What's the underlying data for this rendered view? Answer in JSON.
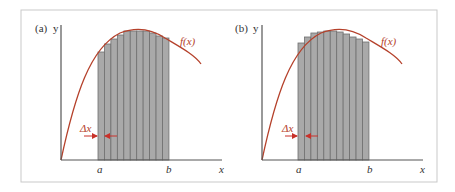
{
  "figure": {
    "frame": {
      "x": 21,
      "y": 10,
      "w": 416,
      "h": 172,
      "stroke": "#c9c9c9"
    },
    "colors": {
      "axis": "#555555",
      "curve": "#b5412b",
      "bar_fill": "#a9a9a9",
      "bar_stroke": "#6f6f6f",
      "arrow": "#c8312a",
      "text": "#333333"
    },
    "panels": [
      {
        "id": "a",
        "panel_label": "(a)",
        "y_label": "y",
        "x_label": "x",
        "a_label": "a",
        "b_label": "b",
        "fx_label": "f(x)",
        "dx_label": "Δx",
        "origin": {
          "x": 61,
          "y": 160
        },
        "y_axis_top": 25,
        "x_axis_right": 222,
        "curve_path": "M61,160 C75,95 90,48 120,33 C135,27 150,28 165,38 C180,47 195,55 201,64",
        "bars_left": 98,
        "bar_width": 6.45,
        "bar_tops": [
          52,
          44,
          39,
          35,
          31,
          31,
          31,
          31,
          33,
          36,
          38
        ],
        "rule": "left-endpoint",
        "fx_pos": {
          "x": 180,
          "y": 45
        },
        "dx_pos": {
          "x": 80,
          "y": 132
        },
        "arrow_left": {
          "x1": 84,
          "x2": 97,
          "y": 136
        },
        "arrow_right": {
          "x1": 117,
          "x2": 105,
          "y": 136
        },
        "a_pos": {
          "x": 97,
          "y": 173
        },
        "b_pos": {
          "x": 166,
          "y": 173
        },
        "x_pos": {
          "x": 219,
          "y": 173
        },
        "label_pos": {
          "x": 35,
          "y": 32
        }
      },
      {
        "id": "b",
        "panel_label": "(b)",
        "y_label": "y",
        "x_label": "x",
        "a_label": "a",
        "b_label": "b",
        "fx_label": "f(x)",
        "dx_label": "Δx",
        "origin": {
          "x": 262,
          "y": 160
        },
        "y_axis_top": 25,
        "x_axis_right": 423,
        "curve_path": "M262,160 C276,95 291,48 321,33 C336,27 351,28 366,38 C381,47 396,55 402,64",
        "bars_left": 298,
        "bar_width": 6.45,
        "bar_tops": [
          43,
          37,
          33,
          32,
          31,
          31,
          32,
          34,
          37,
          39,
          42
        ],
        "rule": "right-endpoint",
        "fx_pos": {
          "x": 381,
          "y": 45
        },
        "dx_pos": {
          "x": 282,
          "y": 132
        },
        "arrow_left": {
          "x1": 285,
          "x2": 297,
          "y": 136
        },
        "arrow_right": {
          "x1": 318,
          "x2": 306,
          "y": 136
        },
        "a_pos": {
          "x": 296,
          "y": 173
        },
        "b_pos": {
          "x": 367,
          "y": 173
        },
        "x_pos": {
          "x": 420,
          "y": 173
        },
        "label_pos": {
          "x": 235,
          "y": 32
        }
      }
    ]
  }
}
